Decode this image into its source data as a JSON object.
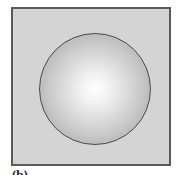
{
  "figure": {
    "caption": "(b)",
    "frame_color": "#d4d4d4",
    "border_color": "#5a5a5a",
    "shape": "sphere",
    "sphere_highlight": "#ffffff",
    "sphere_edge": "#9a9a9a"
  }
}
